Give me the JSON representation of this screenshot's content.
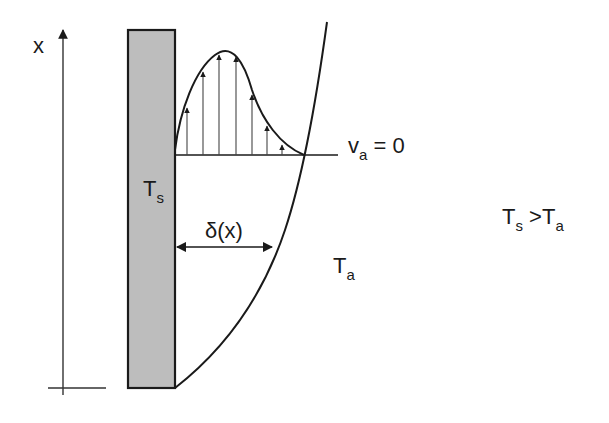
{
  "diagram": {
    "type": "natural-convection-boundary-layer",
    "labels": {
      "axis": "x",
      "wall_temp_main": "T",
      "wall_temp_sub": "s",
      "thickness": "δ(x)",
      "velocity_main": "v",
      "velocity_sub": "a",
      "velocity_rest": " = 0",
      "ambient_main": "T",
      "ambient_sub": "a",
      "cond_ts_main": "T",
      "cond_ts_sub": "s",
      "cond_op": " >",
      "cond_ta_main": "T",
      "cond_ta_sub": "a"
    },
    "colors": {
      "wall_fill": "#bdbdbd",
      "stroke": "#1a1a1a",
      "background": "#ffffff"
    },
    "velocity_arrows_count": 7
  }
}
